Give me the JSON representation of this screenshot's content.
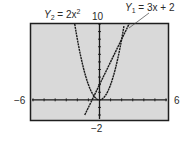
{
  "chart_data": {
    "type": "line",
    "title": "",
    "xlabel": "",
    "ylabel": "",
    "xlim": [
      -6,
      6
    ],
    "ylim": [
      -2,
      10
    ],
    "x_tick_step": 1,
    "y_tick_step": 1,
    "grid": false,
    "tick_labels": {
      "x_min": "−6",
      "x_max": "6",
      "y_min": "−2",
      "y_max": "10"
    },
    "series": [
      {
        "name": "Y1 = 3x + 2",
        "label_var": "Y",
        "label_sub": "1",
        "label_rhs": "= 3x + 2",
        "expression": "3x + 2",
        "x": [
          -1.333,
          2.667
        ],
        "values": [
          -2,
          10
        ]
      },
      {
        "name": "Y2 = 2x^2",
        "label_var": "Y",
        "label_sub": "2",
        "label_rhs": "= 2x",
        "label_sup": "2",
        "expression": "2x^2",
        "x": [
          -2.236,
          -2,
          -1.5,
          -1,
          -0.5,
          0,
          0.5,
          1,
          1.5,
          2,
          2.236
        ],
        "values": [
          10,
          8,
          4.5,
          2,
          0.5,
          0,
          0.5,
          2,
          4.5,
          8,
          10
        ]
      }
    ],
    "colors": {
      "screen_bg": "#d9d9d9",
      "frame": "#1e1e1e",
      "curve": "#1a1a1a",
      "page_bg": "#ffffff"
    }
  }
}
